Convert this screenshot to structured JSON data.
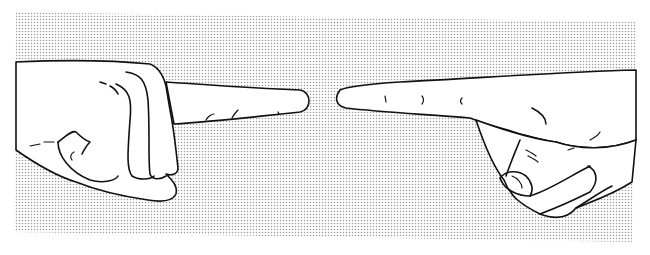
{
  "illustration": {
    "subject": "two hands pointing index fingers toward each other",
    "style": "black line art on halftone dotted background",
    "colors": {
      "background": "#ffffff",
      "halftone_dot": "#9a9a9a",
      "line": "#111111",
      "skin_fill": "#ffffff"
    },
    "elements": [
      {
        "name": "left-hand",
        "description": "fist with index finger pointing right"
      },
      {
        "name": "right-hand",
        "description": "hand with index finger pointing left, thumb tucked under"
      }
    ]
  }
}
